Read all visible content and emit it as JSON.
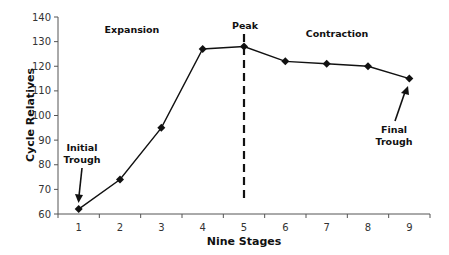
{
  "chart_data": {
    "type": "line",
    "title": "",
    "xlabel": "Nine Stages",
    "ylabel": "Cycle Relatives",
    "categories": [
      "1",
      "2",
      "3",
      "4",
      "5",
      "6",
      "7",
      "8",
      "9"
    ],
    "series": [
      {
        "name": "Cycle Relatives",
        "values": [
          62,
          74,
          95,
          127,
          128,
          122,
          121,
          120,
          115
        ],
        "marker": "diamond",
        "color": "#111111"
      }
    ],
    "ylim": [
      60,
      140
    ],
    "yticks": [
      60,
      70,
      80,
      90,
      100,
      110,
      120,
      130,
      140
    ],
    "grid": false,
    "legend": "none",
    "annotations": [
      {
        "text": "Expansion",
        "kind": "region-label"
      },
      {
        "text": "Peak",
        "kind": "vertical-dashed-line",
        "at": "5"
      },
      {
        "text": "Contraction",
        "kind": "region-label"
      },
      {
        "text": "Initial Trough",
        "kind": "arrow",
        "points_to": "1"
      },
      {
        "text": "Final Trough",
        "kind": "arrow",
        "points_to": "9"
      }
    ]
  },
  "labels": {
    "expansion": "Expansion",
    "peak": "Peak",
    "contraction": "Contraction",
    "initial_line1": "Initial",
    "initial_line2": "Trough",
    "final_line1": "Final",
    "final_line2": "Trough"
  }
}
